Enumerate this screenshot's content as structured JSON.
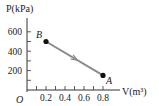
{
  "chart_data": {
    "type": "line",
    "title": "",
    "xlabel": "V(m³)",
    "ylabel": "P(kPa)",
    "origin_label": "O",
    "xlim": [
      0,
      0.9
    ],
    "ylim": [
      0,
      650
    ],
    "x_ticks": [
      0.1,
      0.2,
      0.3,
      0.4,
      0.5,
      0.6,
      0.7,
      0.8
    ],
    "x_tick_labels": [
      {
        "value": 0.2,
        "text": "0.2"
      },
      {
        "value": 0.4,
        "text": "0.4"
      },
      {
        "value": 0.6,
        "text": "0.6"
      },
      {
        "value": 0.8,
        "text": "0.8"
      }
    ],
    "y_ticks": [
      100,
      200,
      300,
      400,
      500,
      600
    ],
    "y_tick_labels": [
      {
        "value": 200,
        "text": "200"
      },
      {
        "value": 400,
        "text": "400"
      },
      {
        "value": 600,
        "text": "600"
      }
    ],
    "grid": false,
    "series": [
      {
        "name": "process B to A",
        "direction": "B→A",
        "points": [
          {
            "label": "B",
            "x": 0.2,
            "y": 500
          },
          {
            "label": "A",
            "x": 0.8,
            "y": 150
          }
        ],
        "line_color": "#8a8a8a",
        "point_color": "#111111"
      }
    ]
  }
}
